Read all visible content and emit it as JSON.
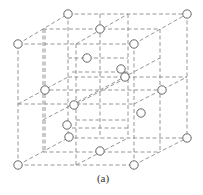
{
  "figure": {
    "caption": "(a)",
    "line_color": "#8a8a8a",
    "circle_stroke": "#555555",
    "circle_radius": 4.2,
    "lines": [
      [
        18,
        44,
        134,
        44
      ],
      [
        18,
        165,
        134,
        165
      ],
      [
        18,
        44,
        18,
        165
      ],
      [
        134,
        44,
        134,
        165
      ],
      [
        68,
        14,
        187,
        14
      ],
      [
        68,
        138,
        187,
        138
      ],
      [
        68,
        14,
        68,
        138
      ],
      [
        187,
        14,
        187,
        138
      ],
      [
        18,
        44,
        68,
        14
      ],
      [
        134,
        44,
        187,
        14
      ],
      [
        18,
        165,
        68,
        138
      ],
      [
        134,
        165,
        187,
        138
      ],
      [
        43,
        29,
        160,
        29
      ],
      [
        43,
        152,
        160,
        152
      ],
      [
        43,
        29,
        43,
        152
      ],
      [
        160,
        29,
        160,
        152
      ],
      [
        76,
        44,
        76,
        165
      ],
      [
        18,
        104,
        134,
        104
      ],
      [
        45,
        29,
        45,
        152
      ],
      [
        100,
        14,
        100,
        138
      ],
      [
        68,
        77,
        187,
        77
      ],
      [
        128,
        14,
        128,
        138
      ],
      [
        43,
        90,
        160,
        90
      ],
      [
        76,
        44,
        128,
        14
      ],
      [
        76,
        165,
        128,
        138
      ],
      [
        18,
        104,
        68,
        77
      ],
      [
        134,
        104,
        187,
        77
      ],
      [
        72,
        72,
        128,
        72
      ],
      [
        68,
        58,
        128,
        58
      ],
      [
        76,
        120,
        128,
        120
      ],
      [
        72,
        128,
        128,
        128
      ],
      [
        100,
        90,
        160,
        58
      ],
      [
        43,
        120,
        100,
        90
      ],
      [
        76,
        104,
        128,
        77
      ]
    ],
    "circles": [
      [
        68,
        14
      ],
      [
        187,
        14
      ],
      [
        18,
        44
      ],
      [
        134,
        44
      ],
      [
        100,
        29
      ],
      [
        87,
        58
      ],
      [
        121,
        69
      ],
      [
        125,
        77
      ],
      [
        45,
        90
      ],
      [
        162,
        90
      ],
      [
        74,
        105
      ],
      [
        141,
        113
      ],
      [
        67,
        125
      ],
      [
        69,
        137
      ],
      [
        187,
        138
      ],
      [
        100,
        151
      ],
      [
        18,
        165
      ],
      [
        134,
        165
      ]
    ]
  }
}
